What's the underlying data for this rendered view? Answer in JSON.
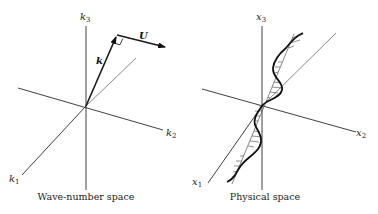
{
  "left_panel": {
    "caption": "Wave-number space",
    "axes": {
      "k1": {
        "base": "k",
        "sub": "1"
      },
      "k2": {
        "base": "k",
        "sub": "2"
      },
      "k3": {
        "base": "k",
        "sub": "3"
      }
    },
    "vectors": {
      "k": "k",
      "U": "U"
    }
  },
  "right_panel": {
    "caption": "Physical space",
    "axes": {
      "x1": {
        "base": "x",
        "sub": "1"
      },
      "x2": {
        "base": "x",
        "sub": "2"
      },
      "x3": {
        "base": "x",
        "sub": "3"
      }
    }
  }
}
